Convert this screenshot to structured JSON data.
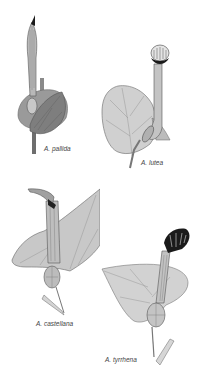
{
  "plate": {
    "background": "#ffffff",
    "figures": [
      {
        "id": "pallida",
        "label": "A. pallida",
        "label_pos": {
          "x": 44,
          "y": 145
        }
      },
      {
        "id": "lutea",
        "label": "A. lutea",
        "label_pos": {
          "x": 141,
          "y": 159
        }
      },
      {
        "id": "castellana",
        "label": "A. castellana",
        "label_pos": {
          "x": 36,
          "y": 320
        }
      },
      {
        "id": "tyrrhena",
        "label": "A. tyrrhena",
        "label_pos": {
          "x": 105,
          "y": 356
        }
      }
    ],
    "colors": {
      "leaf_light": "#d4d4d4",
      "leaf_mid": "#a8a8a8",
      "leaf_dark": "#7a7a7a",
      "outline": "#555555",
      "flower_dark": "#1a1a1a",
      "label": "#444444"
    }
  }
}
